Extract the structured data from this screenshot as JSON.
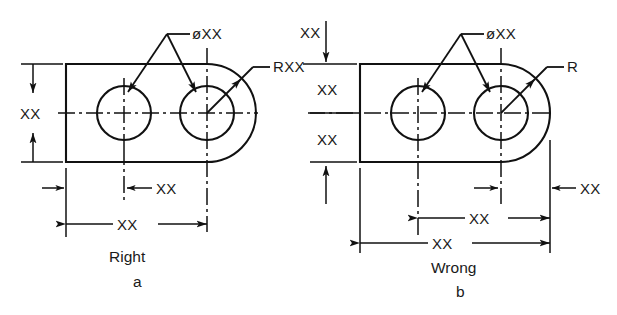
{
  "figure": {
    "background_color": "#ffffff",
    "line_color": "#111111",
    "text_color": "#1a1a1a"
  },
  "symbols": {
    "diameter": "ø"
  },
  "panel_a": {
    "id": "a",
    "verdict_label": "Right",
    "figure_letter": "a",
    "callouts": {
      "diameter_label": "øXX",
      "radius_label": "RXX"
    },
    "dimensions": {
      "height": "XX",
      "hole_offset": "XX",
      "overall_length": "XX"
    }
  },
  "panel_b": {
    "id": "b",
    "verdict_label": "Wrong",
    "figure_letter": "b",
    "callouts": {
      "diameter_label": "øXX",
      "radius_label": "R"
    },
    "dimensions": {
      "top_height": "XX",
      "upper_half": "XX",
      "lower_half": "XX",
      "edge_offset": "XX",
      "hole_to_hole": "XX",
      "overall_length": "XX"
    }
  }
}
